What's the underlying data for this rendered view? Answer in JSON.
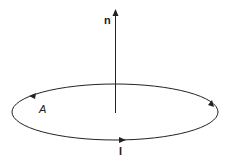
{
  "diagram": {
    "normal_label": "n",
    "area_label": "A",
    "current_label": "I",
    "stroke_color": "#222222"
  }
}
